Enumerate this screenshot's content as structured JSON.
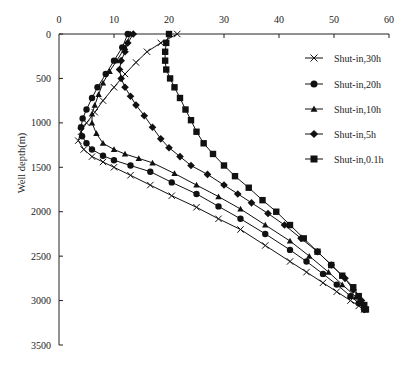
{
  "chart_data": {
    "type": "line",
    "title": "",
    "xlabel": "",
    "ylabel": "Well depth(m)",
    "xlim": [
      0,
      60
    ],
    "ylim": [
      0,
      3500
    ],
    "y_inverted": true,
    "x_axis_position": "top",
    "x_ticks": [
      0,
      10,
      20,
      30,
      40,
      50,
      60
    ],
    "y_ticks": [
      0,
      500,
      1000,
      1500,
      2000,
      2500,
      3000,
      3500
    ],
    "grid": false,
    "legend_position": "upper right inside",
    "series": [
      {
        "name": "Shut-in,30h",
        "marker": "x",
        "points": [
          [
            21.5,
            0
          ],
          [
            18.5,
            100
          ],
          [
            16,
            200
          ],
          [
            14,
            320
          ],
          [
            12,
            450
          ],
          [
            10,
            600
          ],
          [
            8,
            750
          ],
          [
            6.5,
            880
          ],
          [
            5,
            1000
          ],
          [
            4,
            1100
          ],
          [
            3.5,
            1200
          ],
          [
            4.5,
            1300
          ],
          [
            6,
            1380
          ],
          [
            8,
            1440
          ],
          [
            10,
            1500
          ],
          [
            13,
            1590
          ],
          [
            16.6,
            1700
          ],
          [
            20.5,
            1820
          ],
          [
            25,
            1950
          ],
          [
            29,
            2080
          ],
          [
            33,
            2200
          ],
          [
            37.5,
            2380
          ],
          [
            42,
            2560
          ],
          [
            45,
            2680
          ],
          [
            48,
            2800
          ],
          [
            50.5,
            2900
          ],
          [
            53,
            3000
          ],
          [
            54.5,
            3060
          ],
          [
            55.5,
            3100
          ]
        ]
      },
      {
        "name": "Shut-in,20h",
        "marker": "circle",
        "points": [
          [
            12.5,
            0
          ],
          [
            11.5,
            150
          ],
          [
            10,
            300
          ],
          [
            8.5,
            450
          ],
          [
            7,
            600
          ],
          [
            6,
            720
          ],
          [
            5,
            850
          ],
          [
            4.3,
            950
          ],
          [
            4,
            1050
          ],
          [
            4.2,
            1150
          ],
          [
            5,
            1230
          ],
          [
            6,
            1300
          ],
          [
            8,
            1370
          ],
          [
            10,
            1420
          ],
          [
            13,
            1480
          ],
          [
            16.6,
            1550
          ],
          [
            20.5,
            1670
          ],
          [
            25,
            1800
          ],
          [
            29,
            1940
          ],
          [
            33,
            2080
          ],
          [
            37.5,
            2250
          ],
          [
            42,
            2430
          ],
          [
            45,
            2560
          ],
          [
            48,
            2700
          ],
          [
            50.5,
            2820
          ],
          [
            53,
            2950
          ],
          [
            54.5,
            3030
          ],
          [
            55.5,
            3100
          ]
        ]
      },
      {
        "name": "Shut-in,10h",
        "marker": "triangle",
        "points": [
          [
            13,
            0
          ],
          [
            12,
            150
          ],
          [
            10.5,
            300
          ],
          [
            9.2,
            420
          ],
          [
            8,
            550
          ],
          [
            7.2,
            680
          ],
          [
            6.5,
            800
          ],
          [
            6,
            900
          ],
          [
            6,
            1000
          ],
          [
            6.8,
            1120
          ],
          [
            8,
            1230
          ],
          [
            10,
            1300
          ],
          [
            12,
            1350
          ],
          [
            14.5,
            1400
          ],
          [
            17,
            1450
          ],
          [
            21,
            1570
          ],
          [
            25,
            1700
          ],
          [
            29,
            1830
          ],
          [
            33,
            1970
          ],
          [
            37.5,
            2150
          ],
          [
            42,
            2330
          ],
          [
            45.5,
            2500
          ],
          [
            49,
            2680
          ],
          [
            51.5,
            2820
          ],
          [
            54,
            2960
          ],
          [
            55,
            3030
          ],
          [
            55.5,
            3100
          ]
        ]
      },
      {
        "name": "Shut-in,5h",
        "marker": "diamond",
        "points": [
          [
            13.5,
            0
          ],
          [
            12.5,
            100
          ],
          [
            12,
            200
          ],
          [
            11.3,
            300
          ],
          [
            11,
            400
          ],
          [
            11.3,
            500
          ],
          [
            12,
            600
          ],
          [
            13,
            700
          ],
          [
            14,
            800
          ],
          [
            15.5,
            920
          ],
          [
            17,
            1050
          ],
          [
            18.5,
            1180
          ],
          [
            20,
            1280
          ],
          [
            22,
            1380
          ],
          [
            24,
            1480
          ],
          [
            27,
            1580
          ],
          [
            30,
            1700
          ],
          [
            32.5,
            1800
          ],
          [
            35,
            1900
          ],
          [
            38,
            2020
          ],
          [
            41,
            2150
          ],
          [
            44,
            2300
          ],
          [
            47,
            2450
          ],
          [
            49.5,
            2600
          ],
          [
            52,
            2750
          ],
          [
            53.5,
            2880
          ],
          [
            55,
            3000
          ],
          [
            55.5,
            3100
          ]
        ]
      },
      {
        "name": "Shut-in,0.1h",
        "marker": "square",
        "points": [
          [
            20,
            0
          ],
          [
            19.5,
            100
          ],
          [
            19.3,
            200
          ],
          [
            19.3,
            300
          ],
          [
            19.5,
            400
          ],
          [
            20.2,
            500
          ],
          [
            21,
            600
          ],
          [
            22,
            720
          ],
          [
            23,
            850
          ],
          [
            24,
            970
          ],
          [
            25,
            1100
          ],
          [
            26.3,
            1230
          ],
          [
            28,
            1350
          ],
          [
            30,
            1480
          ],
          [
            32,
            1600
          ],
          [
            34.5,
            1730
          ],
          [
            37,
            1870
          ],
          [
            39.5,
            2000
          ],
          [
            42,
            2150
          ],
          [
            44.5,
            2300
          ],
          [
            47,
            2450
          ],
          [
            49.5,
            2600
          ],
          [
            51.5,
            2720
          ],
          [
            53.5,
            2850
          ],
          [
            54.5,
            2950
          ],
          [
            55.5,
            3050
          ],
          [
            55.8,
            3100
          ]
        ]
      }
    ]
  }
}
